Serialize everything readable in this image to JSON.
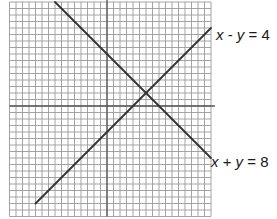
{
  "chart_data": {
    "type": "line",
    "title": "",
    "xlabel": "",
    "ylabel": "",
    "grid": true,
    "xlim": [
      -15,
      16
    ],
    "ylim": [
      -17,
      16
    ],
    "series": [
      {
        "name": "x - y = 4",
        "equation": "y = x - 4",
        "x": [
          -11,
          16
        ],
        "y": [
          -15,
          12
        ]
      },
      {
        "name": "x + y = 8",
        "equation": "y = 8 - x",
        "x": [
          -8,
          16
        ],
        "y": [
          16,
          -8
        ]
      }
    ],
    "intersection": {
      "x": 6,
      "y": 2
    },
    "annotations": [
      {
        "text": "x - y = 4",
        "near_series": 0
      },
      {
        "text": "x + y = 8",
        "near_series": 1
      }
    ],
    "colors": {
      "grid": "#9a9a9a",
      "axis": "#555555",
      "line": "#333333",
      "text": "#1a1a1a"
    }
  },
  "labels": {
    "line1": {
      "x": "x",
      "op": " - ",
      "y": "y",
      "rest": " = 4"
    },
    "line2": {
      "x": "x",
      "op": " + ",
      "y": "y",
      "rest": " = 8"
    }
  }
}
